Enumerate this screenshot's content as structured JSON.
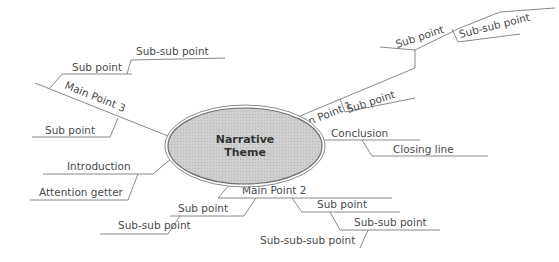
{
  "center": {
    "line1": "Narrative",
    "line2": "Theme",
    "fill": "#c8c8c8",
    "stroke": "#8a8a8a"
  },
  "branches": {
    "main1": {
      "label": "Main Point 1",
      "sub1": "Sub point",
      "sub2": "Sub point",
      "subsub": "Sub-sub point"
    },
    "main2": {
      "label": "Main Point 2",
      "sub_left": "Sub point",
      "subsub_left": "Sub-sub point",
      "sub_right": "Sub point",
      "subsub_right": "Sub-sub point",
      "subsubsub": "Sub-sub-sub point"
    },
    "main3": {
      "label": "Main Point 3",
      "sub_top": "Sub point",
      "subsub_top": "Sub-sub point",
      "sub_bottom": "Sub point"
    },
    "intro": {
      "label": "Introduction",
      "sub": "Attention getter"
    },
    "conclusion": {
      "label": "Conclusion",
      "sub": "Closing line"
    }
  }
}
